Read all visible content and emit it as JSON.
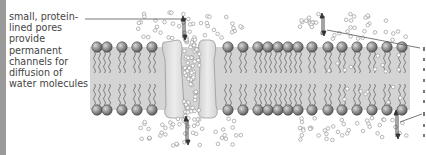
{
  "figure": {
    "annotation": {
      "lines": [
        "small, protein-",
        "lined pores",
        "provide",
        "permanent",
        "channels for",
        "diffusion of",
        "water molecules"
      ]
    },
    "colors": {
      "bilayer_band": "#d4d4d4",
      "protein_channel": "#e4e4e4",
      "head": "#8c8c8c",
      "tail": "#6f6f6f",
      "molecule_outline": "#9a9a9a",
      "text": "#444444",
      "left_bar": "#9a9a9a"
    }
  }
}
